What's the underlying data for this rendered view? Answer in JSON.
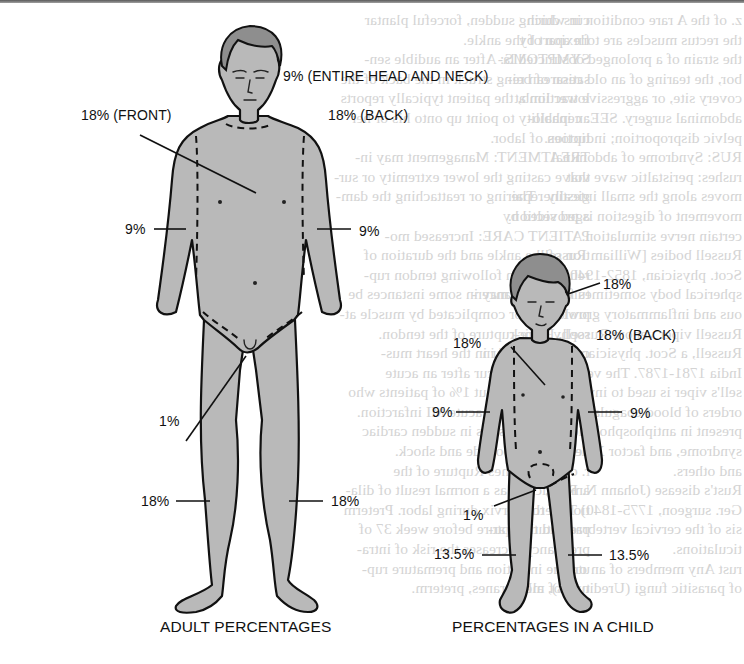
{
  "diagram": {
    "colors": {
      "skin": "#b9b9b9",
      "hair": "#8e8e8e",
      "outline": "#111111",
      "text": "#111111",
      "bleed_text": "#d4d4d4"
    },
    "adult": {
      "caption": "ADULT PERCENTAGES",
      "labels": {
        "head_neck": "9% (ENTIRE HEAD AND NECK)",
        "torso_front": "18% (FRONT)",
        "torso_back": "18% (BACK)",
        "arm_left": "9%",
        "arm_right": "9%",
        "perineum": "1%",
        "leg_left": "18%",
        "leg_right": "18%"
      }
    },
    "child": {
      "caption": "PERCENTAGES IN A CHILD",
      "labels": {
        "head": "18%",
        "torso_front": "18%",
        "torso_back": "18% (BACK)",
        "arm_left": "9%",
        "arm_right": "9%",
        "perineum": "1%",
        "leg_left": "13.5%",
        "leg_right": "13.5%"
      }
    }
  },
  "background_text": {
    "left_column": [
      "z. of the A rare condition in which",
      "the rectus muscles are torn apart by",
      "the strain of a prolonged obstructed la-",
      "bor, the tearing of an old cesarean re-",
      "covery site, or aggressive traction at",
      "abdominal surgery. SEE: cephalo-",
      "pelvic disproportion; induction of labor.",
      "RUS: Syndrome of abdominal",
      "rushes: peristaltic wave that",
      "moves along the small intestine. The",
      "movement of digestion is provided by",
      "certain nerve stimulation.",
      "Russell bodies [William Russell,",
      "Scot. physician, 1852-1940] A small",
      "spherical body sometimes found in cancer-",
      "ous and inflammatory growths.",
      "Russell viper venom Russell, Patrick",
      "Russell, a Scot. physician who worked in",
      "India 1781-1787. The venom from Rus-",
      "sell's viper is used to investigate dis-",
      "orders of blood coagulation, such as are",
      "present in antiphospholipid antibody",
      "syndrome, and factor X deficiency",
      "and others.",
      "Rust's disease (Johann N. Rust,",
      "Ger. surgeon, 1775-1840) Tuberculo-",
      "sis of the cervical vertebrae and their ar-",
      "ticulations.",
      "rust Any members of an order",
      "of parasitic fungi (Uredinales), all of"
    ],
    "right_column": [
      "curs during sudden, forceful plantar",
      "flexion of the ankle.",
      "SYMPTOMS: After an audible sen-",
      "sation of being struck in the back of the",
      "lower limb, the patient typically reports",
      "an inability to point up onto his or her",
      "tiptoes.",
      "TREATMENT: Management may in-",
      "volve casting the lower extremity or sur-",
      "gically repairing or reattaching the dam-",
      "aged section.",
      "PATIENT CARE: Increased mo-",
      "tion of the ankle and the duration of",
      "rehabilitation following tendon rup-",
      "tures, which may in some instances be",
      "prolonged or complicated by muscle at-",
      "rophy or re-rupture of the tendon.",
      "cardiac r. A tear in the heart mus-",
      "cle that may occur after an acute",
      "trauma or in about 1% of patients who",
      "have suffered an acute MI infarction.",
      "It typically results in sudden cardiac",
      "death or tamponade and shock.",
      "r. of membranes Rupture of the",
      "amniotic sac as a normal result of dila-",
      "tion of the cervix during labor. Preterm",
      "premature rupture before week 37 of",
      "pregnancy increases the risk of intra-",
      "uterine infection and premature rup-",
      "ture of membranes, preterm."
    ]
  }
}
